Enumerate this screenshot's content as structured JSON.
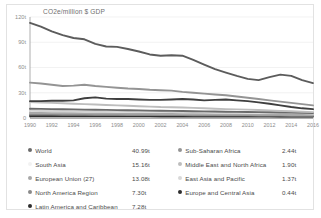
{
  "chart_data": {
    "type": "line",
    "title": "CO2e/million $ GDP",
    "xlabel": "",
    "ylabel": "CO2e/million $ GDP",
    "xlim": [
      1990,
      2016
    ],
    "ylim": [
      0,
      120
    ],
    "grid": true,
    "legend_position": "bottom",
    "x": [
      1990,
      1991,
      1992,
      1993,
      1994,
      1995,
      1996,
      1997,
      1998,
      1999,
      2000,
      2001,
      2002,
      2003,
      2004,
      2005,
      2006,
      2007,
      2008,
      2009,
      2010,
      2011,
      2012,
      2013,
      2014,
      2015,
      2016
    ],
    "xticks": [
      "1990",
      "1992",
      "1994",
      "1996",
      "1998",
      "2000",
      "2002",
      "2004",
      "2006",
      "2008",
      "2010",
      "2012",
      "2014",
      "2016"
    ],
    "yticks": [
      "0",
      "30t",
      "60t",
      "90t",
      "120t"
    ],
    "series": [
      {
        "name": "Europe and Central Asia",
        "color": "#5c5c5c",
        "final_value": "0.44t",
        "values": [
          113.0,
          108.5,
          103.0,
          98.5,
          95.0,
          93.5,
          88.0,
          85.0,
          84.5,
          82.0,
          79.0,
          75.5,
          74.0,
          74.5,
          74.0,
          69.0,
          63.5,
          58.0,
          54.0,
          50.0,
          46.5,
          45.0,
          48.5,
          51.5,
          50.0,
          45.0,
          41.5
        ]
      },
      {
        "name": "Sub-Saharan Africa",
        "color": "#949494",
        "final_value": "2.44t",
        "values": [
          42.0,
          41.0,
          39.5,
          38.0,
          38.5,
          39.5,
          38.0,
          37.0,
          36.0,
          35.0,
          34.5,
          33.5,
          33.0,
          32.5,
          31.0,
          30.0,
          29.0,
          28.0,
          27.0,
          25.5,
          24.0,
          22.5,
          21.0,
          19.5,
          18.0,
          16.5,
          15.0
        ]
      },
      {
        "name": "Middle East and North Africa",
        "color": "#3f3f3f",
        "final_value": "1.90t",
        "values": [
          20.0,
          20.0,
          20.5,
          20.5,
          21.0,
          23.5,
          24.5,
          23.0,
          22.5,
          22.5,
          22.0,
          21.5,
          21.5,
          22.0,
          22.5,
          22.0,
          21.0,
          21.5,
          22.0,
          21.0,
          20.0,
          18.5,
          17.0,
          15.0,
          13.0,
          11.5,
          10.5
        ]
      },
      {
        "name": "East Asia and Pacific",
        "color": "#bdbdbd",
        "final_value": "1.37t",
        "values": [
          19.0,
          18.5,
          18.0,
          17.5,
          17.0,
          16.5,
          16.0,
          15.5,
          15.0,
          14.5,
          14.0,
          13.5,
          13.0,
          12.8,
          12.5,
          12.0,
          11.5,
          11.0,
          10.5,
          10.2,
          10.0,
          9.5,
          9.0,
          8.5,
          8.0,
          7.5,
          7.0
        ]
      },
      {
        "name": "World",
        "color": "#6b6b6b",
        "final_value": "40.99t",
        "values": [
          11.0,
          10.8,
          10.6,
          10.4,
          10.2,
          10.0,
          9.8,
          9.6,
          9.4,
          9.2,
          9.0,
          8.8,
          8.6,
          8.5,
          8.3,
          8.1,
          7.9,
          7.7,
          7.5,
          7.3,
          7.1,
          7.0,
          6.8,
          6.6,
          6.4,
          6.2,
          6.0
        ]
      },
      {
        "name": "South Asia",
        "color": "#d2d2d2",
        "final_value": "15.16t",
        "values": [
          8.5,
          8.4,
          8.3,
          8.2,
          8.1,
          8.0,
          7.9,
          7.8,
          7.7,
          7.6,
          7.5,
          7.4,
          7.3,
          7.2,
          7.1,
          7.0,
          6.9,
          6.8,
          6.7,
          6.6,
          6.5,
          6.4,
          6.3,
          6.2,
          6.0,
          5.8,
          5.6
        ]
      },
      {
        "name": "European Union (27)",
        "color": "#a8a8a8",
        "final_value": "13.08t",
        "values": [
          6.0,
          5.9,
          5.8,
          5.7,
          5.6,
          5.5,
          5.4,
          5.3,
          5.2,
          5.1,
          5.0,
          4.9,
          4.8,
          4.7,
          4.6,
          4.5,
          4.4,
          4.3,
          4.2,
          4.1,
          4.0,
          3.9,
          3.8,
          3.7,
          3.6,
          3.5,
          3.4
        ]
      },
      {
        "name": "North America Region",
        "color": "#8a8a8a",
        "final_value": "7.30t",
        "values": [
          4.2,
          4.1,
          4.0,
          3.95,
          3.9,
          3.85,
          3.8,
          3.75,
          3.7,
          3.65,
          3.6,
          3.55,
          3.5,
          3.45,
          3.4,
          3.35,
          3.3,
          3.25,
          3.2,
          3.15,
          3.1,
          3.0,
          2.9,
          2.8,
          2.7,
          2.6,
          2.5
        ]
      },
      {
        "name": "Latin America and Caribbean",
        "color": "#2e2e2e",
        "final_value": "7.28t",
        "values": [
          2.4,
          2.38,
          2.36,
          2.34,
          2.32,
          2.3,
          2.28,
          2.26,
          2.24,
          2.22,
          2.2,
          2.18,
          2.16,
          2.14,
          2.12,
          2.1,
          2.08,
          2.06,
          2.04,
          2.02,
          2.0,
          1.95,
          1.9,
          1.85,
          1.8,
          1.75,
          1.7
        ]
      }
    ]
  },
  "legend": {
    "left": [
      {
        "label": "World",
        "value": "40.99t",
        "color": "#6b6b6b"
      },
      {
        "label": "South Asia",
        "value": "15.16t",
        "color": "#f2f2f2"
      },
      {
        "label": "European Union (27)",
        "value": "13.08t",
        "color": "#a8a8a8"
      },
      {
        "label": "North America Region",
        "value": "7.30t",
        "color": "#8a8a8a"
      },
      {
        "label": "Latin America and Caribbean",
        "value": "7.28t",
        "color": "#2e2e2e"
      }
    ],
    "right": [
      {
        "label": "Sub-Saharan Africa",
        "value": "2.44t",
        "color": "#949494"
      },
      {
        "label": "Middle East and North Africa",
        "value": "1.90t",
        "color": "#bdbdbd"
      },
      {
        "label": "East Asia and Pacific",
        "value": "1.37t",
        "color": "#d8d8d8"
      },
      {
        "label": "Europe and Central Asia",
        "value": "0.44t",
        "color": "#2e2e2e"
      }
    ]
  }
}
